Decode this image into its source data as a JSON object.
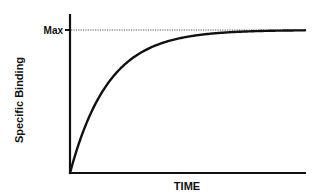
{
  "chart_data": {
    "type": "line",
    "title": "",
    "xlabel": "TIME",
    "ylabel": "Specific Binding",
    "y_ticks": [
      "Max"
    ],
    "annotations": [
      {
        "type": "dotted-horizontal-line",
        "at": "Max"
      }
    ],
    "grid": false,
    "legend": null,
    "series": [
      {
        "name": "Association (one-phase exponential)",
        "x": [
          0,
          0.05,
          0.1,
          0.15,
          0.2,
          0.3,
          0.4,
          0.5,
          0.6,
          0.8,
          1.0
        ],
        "values": [
          0,
          0.46,
          0.71,
          0.84,
          0.92,
          0.975,
          0.993,
          0.998,
          0.999,
          1.0,
          1.0
        ]
      }
    ],
    "xlim": [
      0,
      1
    ],
    "ylim": [
      0,
      1.1
    ]
  },
  "colors": {
    "axis": "#111111",
    "curve": "#111111",
    "max_line": "#555555",
    "background": "#ffffff"
  }
}
